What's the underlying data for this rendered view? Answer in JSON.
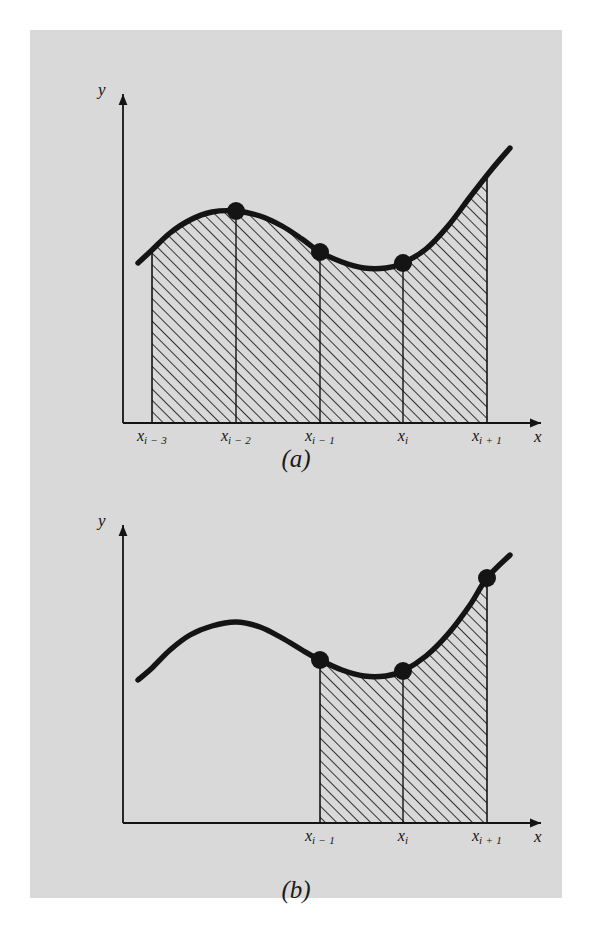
{
  "figure": {
    "background_color": "#d9d9d9",
    "page_color": "#ffffff",
    "ink_color": "#141414",
    "panels": [
      {
        "id": "a",
        "caption": "(a)",
        "axis_x_label": "x",
        "axis_y_label": "y",
        "tick_labels": [
          "x",
          "x",
          "x",
          "x",
          "x"
        ],
        "tick_subscripts": [
          "i − 3",
          "i − 2",
          "i − 1",
          "i",
          "i + 1"
        ]
      },
      {
        "id": "b",
        "caption": "(b)",
        "axis_x_label": "x",
        "axis_y_label": "y",
        "tick_labels": [
          "x",
          "x",
          "x"
        ],
        "tick_subscripts": [
          "i − 1",
          "i",
          "i + 1"
        ]
      }
    ]
  },
  "chart_data": [
    {
      "type": "area",
      "title": "(a)",
      "xlabel": "x",
      "ylabel": "y",
      "grid": false,
      "legend": null,
      "description": "Curve y=f(x) with shaded (hatched) region under the curve spanning the four intervals from x_{i-3} to x_{i+1}; filled circular markers mark the nodes x_{i-2}, x_{i-1}, x_i on the curve.",
      "tick_labels": [
        "x_{i-3}",
        "x_{i-2}",
        "x_{i-1}",
        "x_i",
        "x_{i+1}"
      ],
      "tick_x": [
        122,
        206,
        290,
        373,
        457
      ],
      "baseline_y": 393,
      "curve_points": [
        [
          108,
          233
        ],
        [
          122,
          220
        ],
        [
          140,
          203
        ],
        [
          160,
          190
        ],
        [
          182,
          182
        ],
        [
          206,
          181
        ],
        [
          230,
          186
        ],
        [
          252,
          196
        ],
        [
          272,
          209
        ],
        [
          290,
          222
        ],
        [
          312,
          232
        ],
        [
          334,
          238
        ],
        [
          356,
          238
        ],
        [
          373,
          233
        ],
        [
          396,
          219
        ],
        [
          418,
          196
        ],
        [
          440,
          167
        ],
        [
          462,
          139
        ],
        [
          480,
          118
        ]
      ],
      "markers": [
        {
          "label": "x_{i-2}",
          "x": 206,
          "y": 181
        },
        {
          "label": "x_{i-1}",
          "x": 290,
          "y": 222
        },
        {
          "label": "x_i",
          "x": 373,
          "y": 233
        }
      ],
      "shaded_x_range": [
        "x_{i-3}",
        "x_{i+1}"
      ],
      "interior_dividers": [
        "x_{i-2}",
        "x_{i-1}",
        "x_i"
      ],
      "hatch_angle_deg": 45,
      "hatch_spacing_px": 8
    },
    {
      "type": "area",
      "title": "(b)",
      "xlabel": "x",
      "ylabel": "y",
      "grid": false,
      "legend": null,
      "description": "Same curve y=f(x); shaded (hatched) region under the curve spans only the two intervals from x_{i-1} to x_{i+1}; filled circular markers at x_{i-1}, x_i and x_{i+1}.",
      "tick_labels": [
        "x_{i-1}",
        "x_i",
        "x_{i+1}"
      ],
      "tick_x": [
        290,
        373,
        457
      ],
      "baseline_y": 793,
      "curve_points": [
        [
          108,
          650
        ],
        [
          122,
          638
        ],
        [
          140,
          620
        ],
        [
          160,
          605
        ],
        [
          182,
          596
        ],
        [
          206,
          592
        ],
        [
          230,
          597
        ],
        [
          252,
          608
        ],
        [
          272,
          620
        ],
        [
          290,
          630
        ],
        [
          312,
          640
        ],
        [
          334,
          646
        ],
        [
          356,
          646
        ],
        [
          373,
          641
        ],
        [
          396,
          626
        ],
        [
          418,
          604
        ],
        [
          440,
          575
        ],
        [
          457,
          548
        ],
        [
          480,
          525
        ]
      ],
      "markers": [
        {
          "label": "x_{i-1}",
          "x": 290,
          "y": 630
        },
        {
          "label": "x_i",
          "x": 373,
          "y": 641
        },
        {
          "label": "x_{i+1}",
          "x": 457,
          "y": 548
        }
      ],
      "shaded_x_range": [
        "x_{i-1}",
        "x_{i+1}"
      ],
      "interior_dividers": [
        "x_i"
      ],
      "hatch_angle_deg": 45,
      "hatch_spacing_px": 8
    }
  ]
}
